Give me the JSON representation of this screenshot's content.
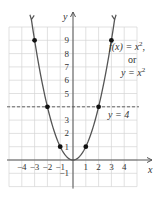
{
  "chart_data": {
    "type": "line",
    "function": "x^2",
    "title": "",
    "xlabel": "x",
    "ylabel": "y",
    "xlim": [
      -5,
      5
    ],
    "ylim": [
      -2,
      10
    ],
    "grid": true,
    "x_ticks": [
      {
        "value": -4,
        "label": "−4"
      },
      {
        "value": -3,
        "label": "−3"
      },
      {
        "value": -2,
        "label": "−2"
      },
      {
        "value": -1,
        "label": "−1"
      },
      {
        "value": 1,
        "label": "1"
      },
      {
        "value": 2,
        "label": "2"
      },
      {
        "value": 3,
        "label": "3"
      },
      {
        "value": 4,
        "label": "4"
      }
    ],
    "y_ticks": [
      {
        "value": -1,
        "label": "−1"
      },
      {
        "value": 1,
        "label": "1"
      },
      {
        "value": 2,
        "label": "2"
      },
      {
        "value": 3,
        "label": "3"
      },
      {
        "value": 5,
        "label": "5"
      },
      {
        "value": 6,
        "label": "6"
      },
      {
        "value": 7,
        "label": "7"
      },
      {
        "value": 8,
        "label": "8"
      },
      {
        "value": 9,
        "label": "9"
      }
    ],
    "series": [
      {
        "name": "f(x) = x^2",
        "x_range": [
          -3.25,
          3.25
        ],
        "color": "#555555"
      }
    ],
    "points": [
      {
        "x": -3,
        "y": 9
      },
      {
        "x": -2,
        "y": 4
      },
      {
        "x": -1,
        "y": 1
      },
      {
        "x": 1,
        "y": 1
      },
      {
        "x": 2,
        "y": 4
      },
      {
        "x": 3,
        "y": 9
      }
    ],
    "reference_lines": [
      {
        "type": "horizontal",
        "y": 4,
        "style": "dashed",
        "label": "y = 4"
      }
    ],
    "annotations": {
      "function_label_line1": "f(x) = x",
      "function_label_exp1": "2",
      "function_label_comma": ",",
      "function_label_or": "or",
      "function_label_line3": "y = x",
      "function_label_exp3": "2",
      "ref_label": "y = 4"
    }
  }
}
